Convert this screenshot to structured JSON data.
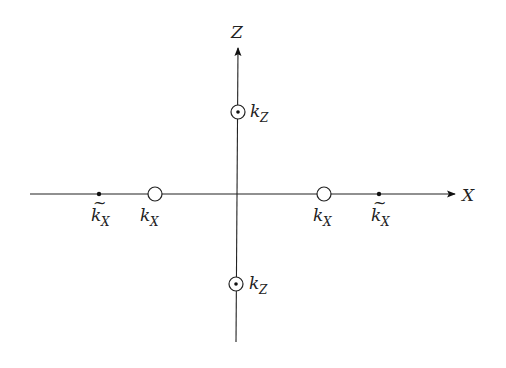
{
  "diagram": {
    "axes": {
      "x": {
        "label": "X"
      },
      "z": {
        "label": "Z"
      }
    },
    "markers": [
      {
        "id": "kx-tilde-left",
        "kind": "dot",
        "label_main": "k",
        "label_sub": "X",
        "tilde": "~"
      },
      {
        "id": "kx-left",
        "kind": "open-circle",
        "label_main": "k",
        "label_sub": "X"
      },
      {
        "id": "kx-right",
        "kind": "open-circle",
        "label_main": "k",
        "label_sub": "X"
      },
      {
        "id": "kx-tilde-right",
        "kind": "dot",
        "label_main": "k",
        "label_sub": "X",
        "tilde": "~"
      },
      {
        "id": "kz-top",
        "kind": "circle-dot",
        "label_main": "k",
        "label_sub": "Z"
      },
      {
        "id": "kz-bottom",
        "kind": "circle-dot",
        "label_main": "k",
        "label_sub": "Z"
      }
    ]
  }
}
